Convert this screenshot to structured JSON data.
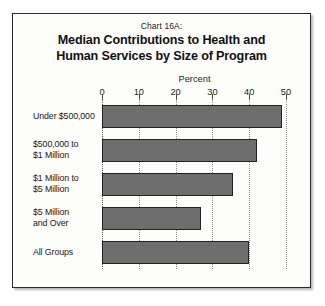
{
  "chart_data": {
    "type": "bar",
    "orientation": "horizontal",
    "chart_number": "Chart 16A:",
    "title_lines": [
      "Median Contributions to Health and",
      "Human Services by Size of Program"
    ],
    "title": "Median Contributions to Health and Human Services by Size of Program",
    "xlabel": "Percent",
    "ylabel": "",
    "xlim": [
      0,
      50
    ],
    "xticks": [
      0,
      10,
      20,
      30,
      40,
      50
    ],
    "xtick_labels": [
      "0",
      "10",
      "20",
      "30",
      "40",
      "50"
    ],
    "grid": true,
    "legend": false,
    "categories": [
      "Under $500,000",
      "$500,000 to $1 Million",
      "$1 Million to $5 Million",
      "$5 Million and Over",
      "All Groups"
    ],
    "category_lines": [
      [
        "Under $500,000"
      ],
      [
        "$500,000 to",
        "$1 Million"
      ],
      [
        "$1 Million to",
        "$5 Million"
      ],
      [
        "$5 Million",
        "and Over"
      ],
      [
        "All Groups"
      ]
    ],
    "values": [
      49,
      42,
      35.5,
      27,
      40
    ],
    "bar_color": "#6e6e6e",
    "bar_edge_color": "#232323"
  }
}
